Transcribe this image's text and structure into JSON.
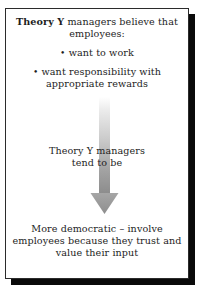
{
  "diagram": {
    "type": "flow-arrow-diagram",
    "heading": {
      "bold_part": "Theory Y",
      "rest": " managers believe that employees:",
      "full": "Theory Y managers believe that employees:"
    },
    "bullets": [
      {
        "marker": "•",
        "text": "want to work"
      },
      {
        "marker": "•",
        "text": "want responsibility with appropriate rewards"
      }
    ],
    "arrow": {
      "name": "down-arrow",
      "direction": "down",
      "label_line_1": "Theory Y managers",
      "label_line_2": "tend to be",
      "gradient_from": "#f7f7f7",
      "gradient_to": "#8f8f8f",
      "head_color": "#9c9c9c"
    },
    "conclusion": "More democratic – involve employees because they trust and value their input",
    "colors": {
      "text": "#1d1d1d",
      "border": "#2b2b2b",
      "shadow": "#0a0a0a",
      "background": "#ffffff"
    }
  }
}
